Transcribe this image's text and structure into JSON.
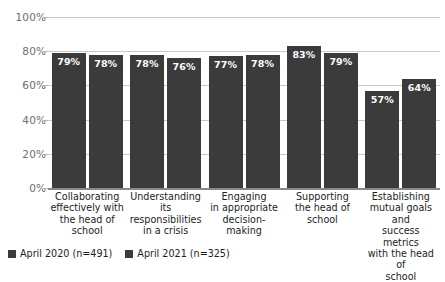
{
  "chart_data": {
    "type": "bar",
    "title": "",
    "subtitle": "",
    "xlabel": "",
    "ylabel": "",
    "ylim": [
      0,
      100
    ],
    "yticks": [
      "0%",
      "20%",
      "40%",
      "60%",
      "80%",
      "100%"
    ],
    "ytick_values": [
      0,
      20,
      40,
      60,
      80,
      100
    ],
    "grid": true,
    "legend_position": "bottom-left",
    "value_suffix": "%",
    "categories": [
      "Collaborating effectively with the head of school",
      "Understanding its responsibilities in a crisis",
      "Engaging in appropriate decision-making",
      "Supporting the head of school",
      "Establishing mutual goals and success metrics with the head of school"
    ],
    "category_lines": [
      [
        "Collaborating",
        "effectively with",
        "the head of",
        "school"
      ],
      [
        "Understanding",
        "its responsibilities",
        "in a crisis"
      ],
      [
        "Engaging",
        "in appropriate",
        "decision-making"
      ],
      [
        "Supporting",
        "the head of",
        "school"
      ],
      [
        "Establishing",
        "mutual goals and",
        "success metrics",
        "with the head of",
        "school"
      ]
    ],
    "series": [
      {
        "name": "April 2020 (n=491)",
        "color": "#3b3b3b",
        "values": [
          79,
          78,
          77,
          83,
          57
        ],
        "labels": [
          "79%",
          "78%",
          "77%",
          "83%",
          "57%"
        ]
      },
      {
        "name": "April 2021 (n=325)",
        "color": "#3b3b3b",
        "values": [
          78,
          76,
          78,
          79,
          64
        ],
        "labels": [
          "78%",
          "76%",
          "78%",
          "79%",
          "64%"
        ]
      }
    ]
  },
  "legend": {
    "items": [
      {
        "label": "April 2020 (n=491)",
        "color": "#3b3b3b"
      },
      {
        "label": "April 2021 (n=325)",
        "color": "#3b3b3b"
      }
    ]
  },
  "colors": {
    "bar": "#3b3b3b",
    "gridline": "#c9c9c9",
    "axis": "#8a8a8a",
    "tick_text": "#6e6e6e",
    "category_text": "#1d1d1d",
    "value_text": "#ffffff",
    "background": "#ffffff"
  }
}
